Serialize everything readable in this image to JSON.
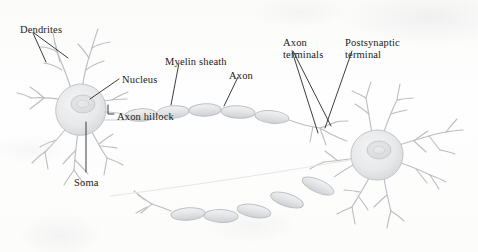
{
  "figure": {
    "medium": "scanned textbook illustration",
    "background_color": "#fdfdfc",
    "ink_color": "#1a1a1a",
    "drawing_color": "#b8b9bd"
  },
  "labels": [
    {
      "id": "dendrites",
      "text": "Dendrites",
      "x": 20,
      "y": 24
    },
    {
      "id": "nucleus",
      "text": "Nucleus",
      "x": 122,
      "y": 74
    },
    {
      "id": "axon-hillock",
      "text": "Axon hillock",
      "x": 117,
      "y": 111
    },
    {
      "id": "soma",
      "text": "Soma",
      "x": 74,
      "y": 177
    },
    {
      "id": "myelin-sheath",
      "text": "Myelin sheath",
      "x": 165,
      "y": 56
    },
    {
      "id": "axon",
      "text": "Axon",
      "x": 229,
      "y": 70
    },
    {
      "id": "axon-terminals",
      "text": "Axon\nterminals",
      "x": 283,
      "y": 37
    },
    {
      "id": "postsynaptic-terminal",
      "text": "Postsynaptic\nterminal",
      "x": 345,
      "y": 37
    }
  ],
  "parts": [
    {
      "id": "presynaptic-neuron",
      "name": "Presynaptic neuron",
      "soma_center_x": 80,
      "soma_center_y": 110
    },
    {
      "id": "postsynaptic-neuron",
      "name": "Postsynaptic neuron",
      "soma_center_x": 377,
      "soma_center_y": 156
    },
    {
      "id": "myelin-segments-upper",
      "name": "Myelinated axon (upper)",
      "segment_count": 5
    },
    {
      "id": "myelin-segments-lower",
      "name": "Myelinated axon (lower)",
      "segment_count": 5
    }
  ]
}
